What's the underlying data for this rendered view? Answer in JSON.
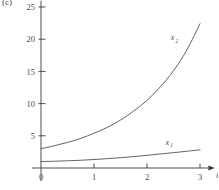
{
  "figure": {
    "panel_label": "(c)",
    "background_color": "#ffffff",
    "line_color": "#5a5a5a",
    "axis_color": "#3b3b3b",
    "text_color": "#4a4a4a"
  },
  "chart_data": {
    "type": "line",
    "title": "",
    "subtitle": "",
    "xlabel": "t",
    "ylabel": "",
    "xlim": [
      0,
      3.12
    ],
    "ylim": [
      0,
      25.5
    ],
    "xticks": [
      0,
      1,
      2,
      3
    ],
    "xtick_labels": [
      "0",
      "1",
      "2",
      "3"
    ],
    "yticks": [
      5,
      10,
      15,
      20,
      25
    ],
    "ytick_labels": [
      "5",
      "10",
      "15",
      "20",
      "25"
    ],
    "origin_label": "0",
    "grid": false,
    "legend": "inline-annotations",
    "annotations": [
      {
        "text": "x",
        "sub": "2",
        "x": 2.45,
        "y": 19.8
      },
      {
        "text": "x",
        "sub": "1",
        "x": 2.35,
        "y": 3.6
      }
    ],
    "series": [
      {
        "name": "x2",
        "label_text": "x",
        "label_sub": "2",
        "x": [
          0,
          0.25,
          0.5,
          0.75,
          1.0,
          1.25,
          1.5,
          1.75,
          2.0,
          2.25,
          2.5,
          2.75,
          3.0
        ],
        "values": [
          3.0,
          3.45,
          3.98,
          4.6,
          5.4,
          6.3,
          7.45,
          8.85,
          10.5,
          12.6,
          15.1,
          18.3,
          22.4
        ]
      },
      {
        "name": "x1",
        "label_text": "x",
        "label_sub": "1",
        "x": [
          0,
          0.25,
          0.5,
          0.75,
          1.0,
          1.25,
          1.5,
          1.75,
          2.0,
          2.25,
          2.5,
          2.75,
          3.0
        ],
        "values": [
          1.0,
          1.05,
          1.12,
          1.2,
          1.32,
          1.45,
          1.6,
          1.78,
          1.96,
          2.18,
          2.38,
          2.6,
          2.82
        ]
      }
    ]
  }
}
